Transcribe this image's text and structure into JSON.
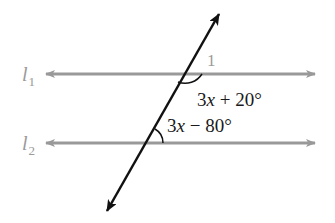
{
  "diagram": {
    "colors": {
      "parallel_lines": "#999999",
      "transversal": "#111111",
      "line_labels": "#9a9a9a",
      "angle_labels": "#1a1a1a"
    },
    "lines": [
      {
        "id": "l1",
        "name": "l",
        "subscript": "1",
        "type": "parallel"
      },
      {
        "id": "l2",
        "name": "l",
        "subscript": "2",
        "type": "parallel"
      },
      {
        "id": "t",
        "type": "transversal"
      }
    ],
    "angles": [
      {
        "id": "angle-1",
        "label": "1",
        "position": "above l1, right of transversal"
      },
      {
        "id": "angle-upper",
        "label": "3x + 20°",
        "position": "below l1, right of transversal"
      },
      {
        "id": "angle-lower",
        "label": "3x − 80°",
        "position": "above l2, right of transversal"
      }
    ]
  }
}
